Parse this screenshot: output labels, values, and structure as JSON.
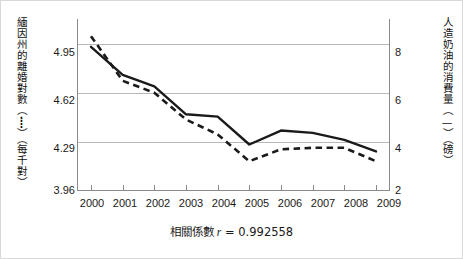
{
  "figure": {
    "caption_label": "相關係數",
    "caption_r_symbol": "r",
    "caption_eq": "=",
    "caption_value": "0.992558"
  },
  "chart_data": {
    "type": "line",
    "title": "",
    "xlabel": "",
    "categories": [
      "2000",
      "2001",
      "2002",
      "2003",
      "2004",
      "2005",
      "2006",
      "2007",
      "2008",
      "2009"
    ],
    "grid": true,
    "legend_position": "axis-titles",
    "series": [
      {
        "name": "緬因州的離婚對數（每千對）",
        "style": "dashed",
        "axis": "left",
        "color": "#1a1a1a",
        "values": [
          5.0,
          4.7,
          4.62,
          4.44,
          4.34,
          4.16,
          4.24,
          4.25,
          4.25,
          4.16
        ]
      },
      {
        "name": "人造奶油的消費量（磅）",
        "style": "solid",
        "axis": "right",
        "color": "#1a1a1a",
        "values": [
          8.2,
          7.0,
          6.5,
          5.3,
          5.2,
          4.0,
          4.6,
          4.5,
          4.2,
          3.7
        ]
      }
    ],
    "left_axis": {
      "title": "緬因州的離婚對數（┋）（每千對）",
      "ticks": [
        "4.95",
        "4.62",
        "4.29",
        "3.96"
      ],
      "tick_values": [
        4.95,
        4.62,
        4.29,
        3.96
      ],
      "ylim": [
        3.96,
        5.115
      ]
    },
    "right_axis": {
      "title": "人造奶油的消費量（—）（磅）",
      "ticks": [
        "8",
        "6",
        "4",
        "2"
      ],
      "tick_values": [
        8,
        6,
        4,
        2
      ],
      "ylim": [
        2,
        9.4
      ]
    }
  },
  "axis_titles": {
    "left": "緬因州的離婚對數（┋）（每千對）",
    "right": "人造奶油的消費量（—）（磅）"
  },
  "ticks": {
    "left": [
      "4.95",
      "4.62",
      "4.29",
      "3.96"
    ],
    "right": [
      "8",
      "6",
      "4",
      "2"
    ],
    "x": [
      "2000",
      "2001",
      "2002",
      "2003",
      "2004",
      "2005",
      "2006",
      "2007",
      "2008",
      "2009"
    ]
  }
}
